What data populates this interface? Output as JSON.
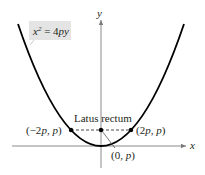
{
  "diagram": {
    "type": "parabola",
    "equation": {
      "base": "x",
      "exponent": "2",
      "rhs": "= 4py"
    },
    "axes": {
      "x_label": "x",
      "y_label": "y"
    },
    "latus_rectum_label": "Latus rectum",
    "points": {
      "left": "(−2p, p)",
      "right": "(2p, p)",
      "focus": "(0, p)"
    },
    "colors": {
      "curve": "#000000",
      "axes": "#7a7a7a",
      "label_bg": "#e4e4e4",
      "text": "#231f20"
    }
  }
}
